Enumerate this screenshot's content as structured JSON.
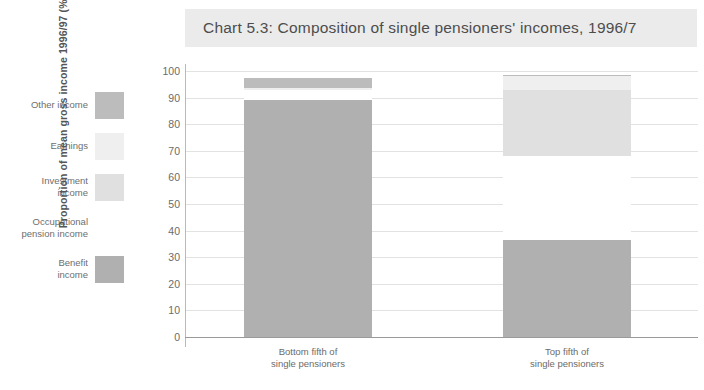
{
  "title": "Chart 5.3: Composition of single pensioners' incomes, 1996/7",
  "legend": {
    "items": [
      {
        "label": "Other income",
        "color": "#bcbcbc"
      },
      {
        "label": "Earnings",
        "color": "#efefef"
      },
      {
        "label": "Investment\nincome",
        "color": "#e0e0e0"
      },
      {
        "label": "Occupational\npension income",
        "color": "#ffffff"
      },
      {
        "label": "Benefit\nincome",
        "color": "#b0b0b0"
      }
    ]
  },
  "chart_data": {
    "type": "bar",
    "subtype": "stacked",
    "title": "Chart 5.3: Composition of single pensioners' incomes, 1996/7",
    "xlabel": "",
    "ylabel": "Proportion of mean gross income 1996/97 (%)",
    "ylim": [
      0,
      100
    ],
    "yticks": [
      0,
      10,
      20,
      30,
      40,
      50,
      60,
      70,
      80,
      90,
      100
    ],
    "ytick_labels": [
      "0",
      "10",
      "20",
      "30",
      "40",
      "50",
      "60",
      "70",
      "80",
      "90",
      "100"
    ],
    "grid": true,
    "legend_position": "left",
    "categories": [
      "Bottom fifth of\nsingle pensioners",
      "Top fifth of\nsingle pensioners"
    ],
    "series": [
      {
        "name": "Benefit income",
        "color": "#b0b0b0",
        "values": [
          89,
          36.5
        ]
      },
      {
        "name": "Occupational pension income",
        "color": "#ffffff",
        "values": [
          4,
          31.5
        ]
      },
      {
        "name": "Investment income",
        "color": "#e0e0e0",
        "values": [
          0,
          25
        ]
      },
      {
        "name": "Earnings",
        "color": "#efefef",
        "values": [
          0.5,
          5
        ]
      },
      {
        "name": "Other income",
        "color": "#bcbcbc",
        "values": [
          4,
          0.5
        ]
      }
    ]
  },
  "axis": {
    "tick_0": "0",
    "tick_10": "10",
    "tick_20": "20",
    "tick_30": "30",
    "tick_40": "40",
    "tick_50": "50",
    "tick_60": "60",
    "tick_70": "70",
    "tick_80": "80",
    "tick_90": "90",
    "tick_100": "100",
    "y_title": "Proportion of mean gross income 1996/97 (%)"
  },
  "categories": {
    "bottom": "Bottom fifth of\nsingle pensioners",
    "top": "Top fifth of\nsingle pensioners"
  }
}
